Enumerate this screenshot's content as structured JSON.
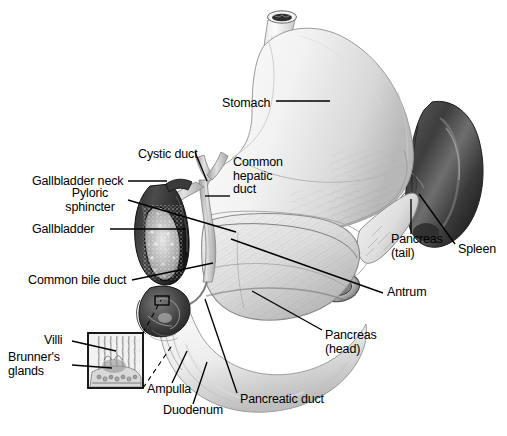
{
  "figure": {
    "width": 507,
    "height": 436,
    "background_color": "#ffffff",
    "line_color": "#000000",
    "style": "grayscale medical line-and-wash illustration"
  },
  "labels": [
    {
      "id": "stomach",
      "text": "Stomach",
      "x": 222,
      "y": 104,
      "align": "left"
    },
    {
      "id": "cystic-duct",
      "text": "Cystic duct",
      "x": 140,
      "y": 155,
      "align": "left"
    },
    {
      "id": "common-hepatic-duct",
      "text": "Common\nhepatic\nduct",
      "x": 233,
      "y": 163,
      "align": "left"
    },
    {
      "id": "gallbladder-neck",
      "text": "Gallbladder neck",
      "x": 33,
      "y": 184,
      "align": "left"
    },
    {
      "id": "pyloric-sphincter",
      "text": "Pyloric\nsphincter",
      "x": 70,
      "y": 198,
      "align": "left"
    },
    {
      "id": "gallbladder",
      "text": "Gallbladder",
      "x": 33,
      "y": 232,
      "align": "left"
    },
    {
      "id": "pancreas-tail",
      "text": "Pancreas\n(tail)",
      "x": 392,
      "y": 240,
      "align": "left"
    },
    {
      "id": "spleen",
      "text": "Spleen",
      "x": 458,
      "y": 250,
      "align": "left"
    },
    {
      "id": "common-bile-duct",
      "text": "Common bile duct",
      "x": 28,
      "y": 283,
      "align": "left"
    },
    {
      "id": "antrum",
      "text": "Antrum",
      "x": 387,
      "y": 295,
      "align": "left"
    },
    {
      "id": "pancreas-head",
      "text": "Pancreas\n(head)",
      "x": 325,
      "y": 336,
      "align": "left"
    },
    {
      "id": "villi",
      "text": "Villi",
      "x": 44,
      "y": 344,
      "align": "left"
    },
    {
      "id": "brunners-glands",
      "text": "Brunner's\nglands",
      "x": 8,
      "y": 361,
      "align": "left"
    },
    {
      "id": "ampulla",
      "text": "Ampulla",
      "x": 147,
      "y": 390,
      "align": "left"
    },
    {
      "id": "pancreatic-duct",
      "text": "Pancreatic duct",
      "x": 240,
      "y": 400,
      "align": "left"
    },
    {
      "id": "duodenum",
      "text": "Duodenum",
      "x": 163,
      "y": 411,
      "align": "left"
    }
  ],
  "leader_lines": [
    {
      "id": "stomach-leader",
      "from": [
        276,
        101
      ],
      "to": [
        330,
        101
      ]
    },
    {
      "id": "cystic-duct-leader",
      "from": [
        195,
        152
      ],
      "to": [
        207,
        180
      ]
    },
    {
      "id": "common-hepatic-duct-leader",
      "from": [
        205,
        196
      ],
      "to": [
        230,
        196
      ]
    },
    {
      "id": "gallbladder-neck-leader",
      "from": [
        128,
        181
      ],
      "to": [
        166,
        181
      ]
    },
    {
      "id": "pyloric-sphincter-leader",
      "from": [
        128,
        200
      ],
      "to": [
        235,
        232
      ]
    },
    {
      "id": "gallbladder-leader",
      "from": [
        110,
        229
      ],
      "to": [
        185,
        229
      ]
    },
    {
      "id": "pancreas-tail-leader",
      "from": [
        411,
        234
      ],
      "to": [
        411,
        200
      ]
    },
    {
      "id": "spleen-leader",
      "from": [
        455,
        244
      ],
      "to": [
        420,
        195
      ]
    },
    {
      "id": "common-bile-duct-leader",
      "from": [
        132,
        280
      ],
      "to": [
        212,
        264
      ]
    },
    {
      "id": "antrum-leader",
      "from": [
        383,
        293
      ],
      "to": [
        232,
        240
      ]
    },
    {
      "id": "pancreas-head-leader",
      "from": [
        322,
        330
      ],
      "to": [
        253,
        292
      ]
    },
    {
      "id": "villi-leader",
      "from": [
        72,
        341
      ],
      "to": [
        115,
        351
      ]
    },
    {
      "id": "brunners-glands-leader",
      "from": [
        72,
        365
      ],
      "to": [
        112,
        368
      ]
    },
    {
      "id": "ampulla-leader",
      "from": [
        172,
        383
      ],
      "to": [
        186,
        352
      ]
    },
    {
      "id": "pancreatic-duct-leader",
      "from": [
        237,
        393
      ],
      "to": [
        206,
        300
      ]
    },
    {
      "id": "duodenum-leader",
      "from": [
        193,
        404
      ],
      "to": [
        206,
        363
      ]
    }
  ],
  "inset": {
    "id": "duodenal-mucosa-inset",
    "box": {
      "x": 88,
      "y": 333,
      "width": 55,
      "height": 55
    },
    "connector_lines": [
      {
        "from": [
          143,
          333
        ],
        "to": [
          160,
          300
        ]
      },
      {
        "from": [
          143,
          388
        ],
        "to": [
          172,
          345
        ]
      }
    ],
    "source_marker": {
      "x": 155,
      "y": 296,
      "width": 14,
      "height": 9
    },
    "description": "magnified duodenal wall showing villi and Brunner's glands"
  },
  "structures": [
    {
      "id": "esophagus",
      "name": "Esophagus"
    },
    {
      "id": "stomach-body",
      "name": "Stomach"
    },
    {
      "id": "antrum-structure",
      "name": "Antrum"
    },
    {
      "id": "gallbladder-body",
      "name": "Gallbladder"
    },
    {
      "id": "cystic-duct-struct",
      "name": "Cystic duct"
    },
    {
      "id": "hepatic-duct",
      "name": "Common hepatic duct"
    },
    {
      "id": "bile-duct",
      "name": "Common bile duct"
    },
    {
      "id": "pancreas-body",
      "name": "Pancreas"
    },
    {
      "id": "duodenum-loop",
      "name": "Duodenum"
    },
    {
      "id": "spleen-body",
      "name": "Spleen"
    }
  ]
}
